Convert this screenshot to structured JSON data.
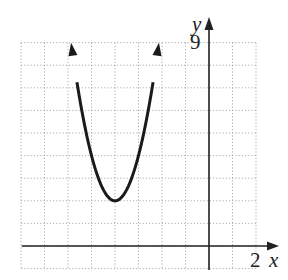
{
  "chart_data": {
    "type": "line",
    "title": "",
    "xlabel": "x",
    "ylabel": "y",
    "xlim": [
      -8,
      2
    ],
    "ylim": [
      -1,
      9
    ],
    "grid": true,
    "tick_labels": {
      "x": [
        "2"
      ],
      "y": [
        "9"
      ]
    },
    "series": [
      {
        "name": "parabola",
        "equation": "y = 2(x+4)^2 + 2",
        "vertex": [
          -4,
          2
        ],
        "x": [
          -5.87,
          -5.5,
          -5,
          -4.5,
          -4,
          -3.5,
          -3,
          -2.5,
          -2.13
        ],
        "y": [
          9,
          6.5,
          4,
          2.5,
          2,
          2.5,
          4,
          6.5,
          9
        ],
        "arrows_both_ends": true
      }
    ]
  },
  "labels": {
    "x_axis": "x",
    "y_axis": "y",
    "x_tick": "2",
    "y_tick": "9"
  }
}
